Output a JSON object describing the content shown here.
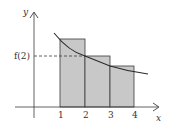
{
  "diagram": {
    "type": "left-riemann-sum",
    "axes": {
      "x_label": "x",
      "y_label": "y",
      "x_ticks": [
        "1",
        "2",
        "3",
        "4"
      ]
    },
    "reference_label": "f(2)",
    "rectangles": [
      {
        "from": "1",
        "to": "2",
        "height_at": "f(1)"
      },
      {
        "from": "2",
        "to": "3",
        "height_at": "f(2)"
      },
      {
        "from": "3",
        "to": "4",
        "height_at": "f(3)"
      }
    ],
    "colors": {
      "rect_fill": "#c8c8c8",
      "stroke": "#3a3a3a",
      "curve": "#2a2a2a"
    }
  }
}
